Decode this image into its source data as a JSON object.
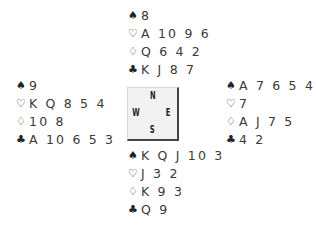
{
  "diagram": {
    "type": "bridge-deal",
    "suit_symbols": {
      "spades": "♠",
      "hearts": "♡",
      "diamonds": "♢",
      "clubs": "♣"
    },
    "compass": {
      "north": "N",
      "west": "W",
      "east": "E",
      "south": "S"
    },
    "hands": {
      "north": {
        "spades": "8",
        "hearts": "A 10 9 6",
        "diamonds": "Q 6 4 2",
        "clubs": "K J 8 7"
      },
      "west": {
        "spades": "9",
        "hearts": "K Q 8 5 4",
        "diamonds": "10 8",
        "clubs": "A 10 6 5 3"
      },
      "east": {
        "spades": "A 7 6 5 4 2",
        "hearts": "7",
        "diamonds": "A J 7 5",
        "clubs": "4 2"
      },
      "south": {
        "spades": "K Q J 10 3",
        "hearts": "J 3 2",
        "diamonds": "K 9 3",
        "clubs": "Q 9"
      }
    }
  }
}
